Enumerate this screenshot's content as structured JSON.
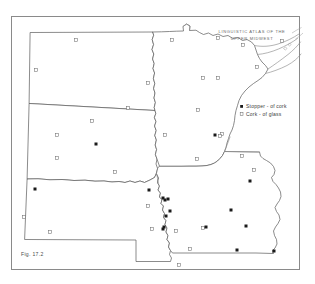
{
  "figure": {
    "caption": "Fig. 17.2",
    "atlas_title_line1": "LINGUISTIC  ATLAS  OF  THE",
    "atlas_title_line2": "UPPER  MIDWEST",
    "top_edge_artifact": ""
  },
  "legend": {
    "items": [
      {
        "marker": "filled-square",
        "label": "Stopper - of  cork"
      },
      {
        "marker": "open-square",
        "label": "Cork - of  glass"
      }
    ]
  },
  "colors": {
    "frame": "#8a8a8a",
    "state_outline": "#5a5a5a",
    "water_outline": "#8c8c8c",
    "marker_filled": "#1a1a1a",
    "marker_open_stroke": "#6e6e6e",
    "background": "#ffffff",
    "title_text": "#6a6a6a",
    "legend_text": "#3c3c3c"
  },
  "chart_data": {
    "type": "scatter",
    "title": "LINGUISTIC ATLAS OF THE UPPER MIDWEST",
    "subtitle": "Fig. 17.2",
    "region": "Upper Midwest United States (North Dakota, South Dakota, Nebraska, Minnesota, Iowa)",
    "xlabel": "",
    "ylabel": "",
    "grid": false,
    "legend_position": "right-center",
    "series": [
      {
        "name": "Stopper - of  cork",
        "marker": "filled-square",
        "color": "#1a1a1a",
        "points": [
          [
            96,
            144
          ],
          [
            35,
            189
          ],
          [
            149,
            190
          ],
          [
            163,
            198
          ],
          [
            165,
            200
          ],
          [
            168,
            199
          ],
          [
            170,
            211
          ],
          [
            164,
            227
          ],
          [
            163,
            229
          ],
          [
            215,
            135
          ],
          [
            250,
            181
          ],
          [
            231,
            210
          ],
          [
            206,
            227
          ],
          [
            246,
            226
          ],
          [
            237,
            250
          ],
          [
            274,
            251
          ],
          [
            166,
            216
          ]
        ]
      },
      {
        "name": "Cork - of  glass",
        "marker": "open-square",
        "color": "#ffffff",
        "points": [
          [
            76,
            40
          ],
          [
            36,
            70
          ],
          [
            148,
            83
          ],
          [
            128,
            108
          ],
          [
            57,
            135
          ],
          [
            92,
            121
          ],
          [
            57,
            158
          ],
          [
            115,
            172
          ],
          [
            24,
            217
          ],
          [
            50,
            232
          ],
          [
            172,
            40
          ],
          [
            218,
            38
          ],
          [
            203,
            78
          ],
          [
            218,
            78
          ],
          [
            198,
            110
          ],
          [
            197,
            159
          ],
          [
            203,
            228
          ],
          [
            243,
            45
          ],
          [
            282,
            41
          ],
          [
            257,
            67
          ],
          [
            222,
            134
          ],
          [
            242,
            156
          ],
          [
            220,
            136
          ],
          [
            254,
            170
          ],
          [
            190,
            249
          ],
          [
            179,
            265
          ],
          [
            148,
            206
          ],
          [
            152,
            229
          ],
          [
            176,
            231
          ],
          [
            165,
            135
          ]
        ]
      }
    ]
  }
}
